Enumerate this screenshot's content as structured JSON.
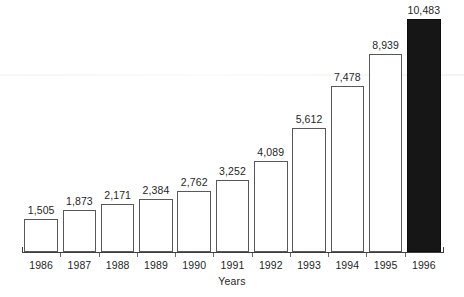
{
  "chart_data": {
    "type": "bar",
    "title": "",
    "subtitle": "",
    "xlabel": "Years",
    "ylabel": "",
    "categories": [
      "1986",
      "1987",
      "1988",
      "1989",
      "1990",
      "1991",
      "1992",
      "1993",
      "1994",
      "1995",
      "1996"
    ],
    "values": [
      1505,
      1873,
      2171,
      2384,
      2762,
      3252,
      4089,
      5612,
      7478,
      8939,
      10483
    ],
    "value_labels": [
      "1,505",
      "1,873",
      "2,171",
      "2,384",
      "2,762",
      "3,252",
      "4,089",
      "5,612",
      "7,478",
      "8,939",
      "10,483"
    ],
    "bar_styles": [
      "outline",
      "outline",
      "outline",
      "outline",
      "outline",
      "outline",
      "outline",
      "outline",
      "outline",
      "outline",
      "filled"
    ],
    "ylim": [
      0,
      11000
    ],
    "grid": false,
    "legend": null,
    "axis_visible": {
      "x": true,
      "y": false
    },
    "colors": {
      "bar_outline": "#58585a",
      "bar_fill": "#ffffff",
      "highlight_fill": "#161616",
      "axis": "#3f3f41",
      "text": "#1f1f1f",
      "background": "#ffffff"
    }
  },
  "axis": {
    "x_title": "Years"
  }
}
